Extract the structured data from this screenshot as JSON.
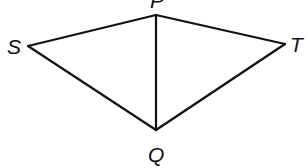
{
  "diagram": {
    "type": "geometry-figure",
    "shape": "kite / quadrilateral with diagonal",
    "vertices": {
      "P": {
        "label": "P",
        "x": 156,
        "y": 15,
        "label_x": 150,
        "label_y": 8
      },
      "S": {
        "label": "S",
        "x": 28,
        "y": 46,
        "label_x": 7,
        "label_y": 54
      },
      "T": {
        "label": "T",
        "x": 285,
        "y": 44,
        "label_x": 290,
        "label_y": 52
      },
      "Q": {
        "label": "Q",
        "x": 156,
        "y": 130,
        "label_x": 148,
        "label_y": 162
      }
    },
    "edges": [
      {
        "from": "S",
        "to": "P"
      },
      {
        "from": "P",
        "to": "T"
      },
      {
        "from": "T",
        "to": "Q"
      },
      {
        "from": "Q",
        "to": "S"
      },
      {
        "from": "P",
        "to": "Q"
      }
    ],
    "line_color": "#111111",
    "background": "#ffffff"
  }
}
